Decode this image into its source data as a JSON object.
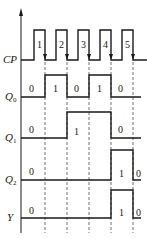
{
  "diagram": {
    "type": "timing-diagram",
    "signals": [
      {
        "name": "CP",
        "subscript": "",
        "label_y": 62
      },
      {
        "name": "Q",
        "subscript": "0",
        "label_y": 99
      },
      {
        "name": "Q",
        "subscript": "1",
        "label_y": 140
      },
      {
        "name": "Q",
        "subscript": "2",
        "label_y": 182
      },
      {
        "name": "Y",
        "subscript": "",
        "label_y": 220
      }
    ],
    "clock_pulse_numbers": [
      "1",
      "2",
      "3",
      "4",
      "5"
    ],
    "Q0_values": [
      "0",
      "1",
      "0",
      "1",
      "0"
    ],
    "Q1_values": [
      "0",
      "1",
      "0"
    ],
    "Q2_values": [
      "0",
      "1",
      "0"
    ],
    "Y_values": [
      "0",
      "1",
      "0"
    ],
    "transitions_at_falling_edges": [
      1,
      2,
      3,
      4,
      5
    ],
    "state_sequence": {
      "Q0": [
        0,
        1,
        0,
        1,
        0,
        0
      ],
      "Q1": [
        0,
        0,
        1,
        1,
        0,
        0
      ],
      "Q2": [
        0,
        0,
        0,
        0,
        1,
        0
      ],
      "Y": [
        0,
        0,
        0,
        0,
        1,
        0
      ]
    },
    "colors": {
      "stroke": "#1a1a1a",
      "background": "#ffffff"
    }
  }
}
